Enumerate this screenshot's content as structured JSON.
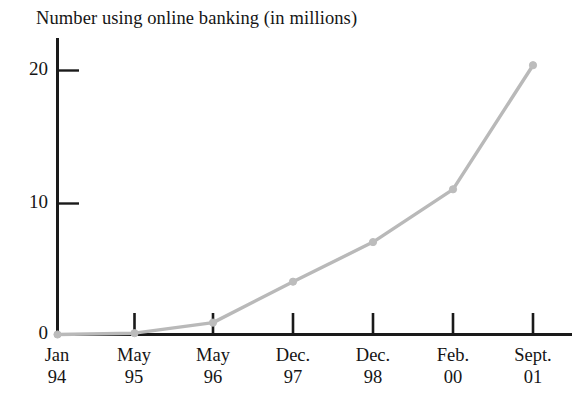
{
  "chart_data": {
    "type": "line",
    "title": "Number using online banking (in millions)",
    "xlabel": "",
    "ylabel": "",
    "categories": [
      "Jan 94",
      "May 95",
      "May 96",
      "Dec. 97",
      "Dec. 98",
      "Feb. 00",
      "Sept. 01"
    ],
    "category_lines": [
      {
        "top": "Jan",
        "bottom": "94"
      },
      {
        "top": "May",
        "bottom": "95"
      },
      {
        "top": "May",
        "bottom": "96"
      },
      {
        "top": "Dec.",
        "bottom": "97"
      },
      {
        "top": "Dec.",
        "bottom": "98"
      },
      {
        "top": "Feb.",
        "bottom": "00"
      },
      {
        "top": "Sept.",
        "bottom": "01"
      }
    ],
    "values": [
      0,
      0.1,
      0.9,
      4.0,
      7.0,
      11.0,
      20.4
    ],
    "series": [
      {
        "name": "Number using online banking (in millions)",
        "values": [
          0,
          0.1,
          0.9,
          4.0,
          7.0,
          11.0,
          20.4
        ]
      }
    ],
    "ylim": [
      0,
      23
    ],
    "yticks": [
      0,
      10,
      20
    ],
    "ytick_labels": [
      "0",
      "10",
      "20"
    ],
    "grid": false,
    "legend": false,
    "legend_position": "none",
    "marker": "circle",
    "line_color": "#b9b9b9",
    "marker_color": "#bcbcbc",
    "axis_color": "#1a1a1a",
    "background_color": "#ffffff"
  }
}
